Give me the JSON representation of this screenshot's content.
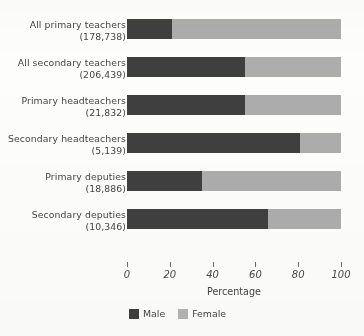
{
  "chart_data": {
    "type": "bar",
    "subtype": "horizontal-stacked-100",
    "title": "",
    "xlabel": "Percentage",
    "ylabel": "",
    "xlim": [
      0,
      100
    ],
    "xticks": [
      0,
      20,
      40,
      60,
      80,
      100
    ],
    "xtick_labels": [
      "0",
      "20",
      "40",
      "60",
      "80",
      "100"
    ],
    "grid": false,
    "legend_position": "bottom-left",
    "categories": [
      "All primary teachers (178,738)",
      "All secondary teachers (206,439)",
      "Primary headteachers (21,832)",
      "Secondary headteachers (5,139)",
      "Primary deputies (18,886)",
      "Secondary deputies (10,346)"
    ],
    "category_lines": [
      {
        "line1": "All primary teachers",
        "line2": "(178,738)"
      },
      {
        "line1": "All secondary teachers",
        "line2": "(206,439)"
      },
      {
        "line1": "Primary headteachers",
        "line2": "(21,832)"
      },
      {
        "line1": "Secondary headteachers",
        "line2": "(5,139)"
      },
      {
        "line1": "Primary deputies",
        "line2": "(18,886)"
      },
      {
        "line1": "Secondary deputies",
        "line2": "(10,346)"
      }
    ],
    "series": [
      {
        "name": "Male",
        "color": "#3f3f3f",
        "values": [
          21,
          55,
          55,
          81,
          35,
          66
        ]
      },
      {
        "name": "Female",
        "color": "#adadad",
        "values": [
          79,
          45,
          45,
          19,
          65,
          34
        ]
      }
    ]
  },
  "legend": {
    "items": [
      {
        "label": "Male",
        "color": "#3f3f3f"
      },
      {
        "label": "Female",
        "color": "#b4b4b4"
      }
    ]
  },
  "axis": {
    "title": "Percentage"
  }
}
